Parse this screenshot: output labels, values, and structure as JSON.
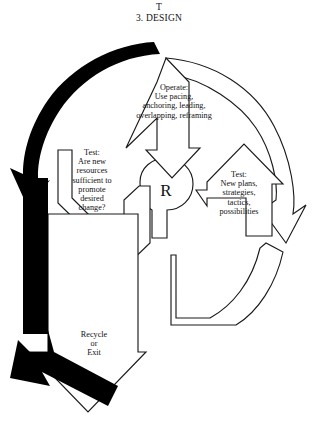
{
  "figure": {
    "kind": "recursive-design-cycle-diagram",
    "stroke_color": "#1a1a1a",
    "fill_color": "#ffffff",
    "solid_arrow_color": "#000000",
    "background": "#ffffff"
  },
  "header": {
    "stage_letter": "T",
    "stage_title": "3. DESIGN"
  },
  "nodes": {
    "operate": "Operate:\nUse pacing,\nanchoring, leading,\noverlapping, reframing",
    "test_left": "Test:\nAre new\nresources\nsufficient to\npromote\ndesired\nchange?",
    "test_right": "Test:\nNew plans,\nstrategies,\ntactics,\npossibilities",
    "hub": "R",
    "exit": "Recycle\nor\nExit"
  },
  "arrows": [
    {
      "name": "feedback-arc",
      "style": "solid-black",
      "direction": "counterclockwise-left",
      "from": "top-center",
      "to": "bottom-left"
    },
    {
      "name": "operate-arrow",
      "style": "outline",
      "direction": "down",
      "to": "hub"
    },
    {
      "name": "test-left-arrow",
      "style": "outline",
      "direction": "down-left"
    },
    {
      "name": "test-right-arrow",
      "style": "outline",
      "direction": "right"
    },
    {
      "name": "return-arc",
      "style": "outline",
      "direction": "clockwise-right"
    },
    {
      "name": "recycle-exit-arrow",
      "style": "outline",
      "direction": "down"
    }
  ]
}
